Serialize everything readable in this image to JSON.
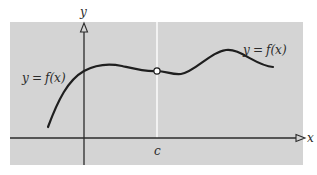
{
  "figure": {
    "colors": {
      "background": "#ffffff",
      "panel": "#d4d4d4",
      "axis": "#2b2b2b",
      "curve": "#1f1f1f",
      "guide_line": "#ffffff",
      "hole_fill": "#ffffff"
    },
    "axes": {
      "x_label": "x",
      "y_label": "y"
    },
    "labels": {
      "curve_left_y": "y",
      "curve_left_eq": "=",
      "curve_left_f": "f(x)",
      "curve_right_y": "y",
      "curve_right_eq": "=",
      "curve_right_f": "f(x)",
      "point_c": "c"
    },
    "features": {
      "hole_at": "c",
      "vertical_guide_at": "c"
    }
  }
}
